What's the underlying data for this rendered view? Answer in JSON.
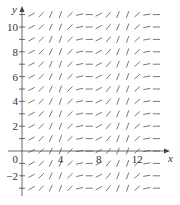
{
  "chart_data": {
    "type": "slope_field",
    "title": "",
    "xlabel": "x",
    "ylabel": "y",
    "x_tick_labels": [
      "0",
      "4",
      "8",
      "12"
    ],
    "x_tick_values": [
      0,
      4,
      8,
      12
    ],
    "y_tick_labels": [
      "-2",
      "0",
      "2",
      "4",
      "6",
      "8",
      "10"
    ],
    "y_tick_values": [
      -2,
      0,
      2,
      4,
      6,
      8,
      10
    ],
    "xlim": [
      -1,
      15
    ],
    "ylim": [
      -4,
      12
    ],
    "grid_x": [
      1,
      2,
      3,
      4,
      5,
      6,
      7,
      8,
      9,
      10,
      11,
      12,
      13,
      14
    ],
    "grid_y": [
      -3,
      -2,
      -1,
      0,
      1,
      2,
      3,
      4,
      5,
      6,
      7,
      8,
      9,
      10,
      11
    ],
    "slope_angle_deg_by_x": [
      28,
      45,
      65,
      70,
      45,
      12,
      0,
      28,
      50,
      68,
      70,
      42,
      10,
      0
    ],
    "grid": false,
    "legend": "none",
    "color": "#555555"
  }
}
